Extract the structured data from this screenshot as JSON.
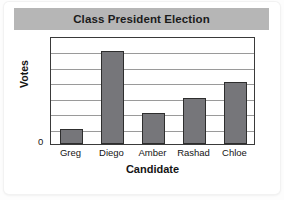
{
  "title": "Class President Election",
  "colors": {
    "banner": "#b6b6b6",
    "bar_fill": "#76767a",
    "bar_stroke": "#2e2e2e",
    "frame": "#3a3a3a",
    "gridline": "#9a9a9a",
    "plot_background": "#ffffff",
    "text": "#141414"
  },
  "axes": {
    "y_title": "Votes",
    "y_zero_tick": "0",
    "x_title": "Candidate"
  },
  "chart_data": {
    "type": "bar",
    "title": "Class President Election",
    "xlabel": "Candidate",
    "ylabel": "Votes",
    "categories": [
      "Greg",
      "Diego",
      "Amber",
      "Rashad",
      "Chloe"
    ],
    "values": [
      1,
      6,
      2,
      3,
      4
    ],
    "ylim": [
      0,
      7
    ],
    "ytick_labels": [
      "0"
    ],
    "grid": true,
    "gridline_count": 6,
    "legend": null
  }
}
